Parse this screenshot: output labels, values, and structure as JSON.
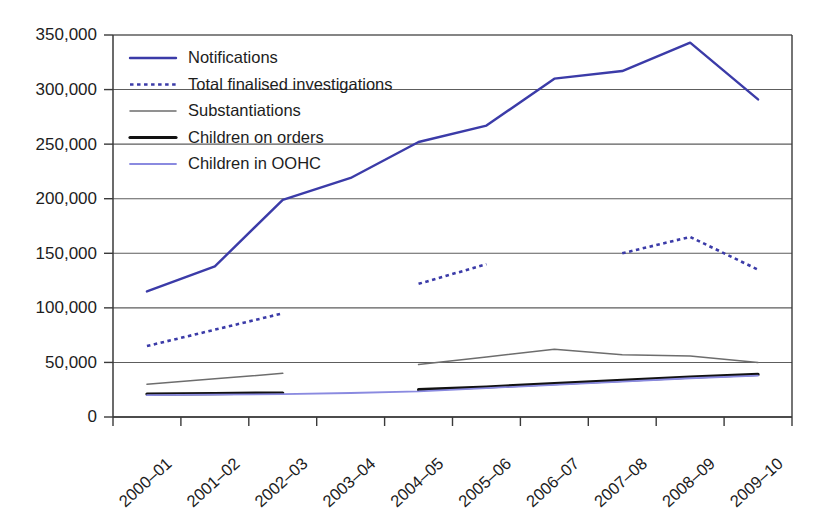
{
  "chart_data": {
    "type": "line",
    "title": "",
    "subtitle": "",
    "xlabel": "",
    "ylabel": "",
    "ylim": [
      0,
      350000
    ],
    "yticks": [
      0,
      50000,
      100000,
      150000,
      200000,
      250000,
      300000,
      350000
    ],
    "ytick_labels": [
      "0",
      "50,000",
      "100,000",
      "150,000",
      "200,000",
      "250,000",
      "300,000",
      "350,000"
    ],
    "grid": "horizontal",
    "legend_position": "inside-top-left",
    "categories": [
      "2000–01",
      "2001–02",
      "2002–03",
      "2003–04",
      "2004–05",
      "2005–06",
      "2006–07",
      "2007–08",
      "2008–09",
      "2009–10"
    ],
    "series": [
      {
        "name": "Notifications",
        "color": "#3b3ba8",
        "style": "solid",
        "width": 2.4,
        "values": [
          115000,
          138000,
          199000,
          219000,
          252000,
          267000,
          310000,
          317000,
          343000,
          291000
        ]
      },
      {
        "name": "Total finalised investigations",
        "color": "#3b3ba8",
        "style": "dotted",
        "width": 2.6,
        "values": [
          65000,
          80000,
          95000,
          null,
          122000,
          140000,
          null,
          150000,
          165000,
          135000
        ]
      },
      {
        "name": "Substantiations",
        "color": "#6d6d6d",
        "style": "solid",
        "width": 1.5,
        "values": [
          30000,
          35000,
          40000,
          null,
          48000,
          55000,
          62000,
          57000,
          56000,
          50000
        ]
      },
      {
        "name": "Children on orders",
        "color": "#121212",
        "style": "solid",
        "width": 3.2,
        "values": [
          21000,
          21500,
          22000,
          null,
          25000,
          27500,
          30500,
          33500,
          36500,
          39000
        ]
      },
      {
        "name": "Children in OOHC",
        "color": "#8a8ae0",
        "style": "solid",
        "width": 1.8,
        "values": [
          20000,
          20500,
          21000,
          22000,
          23500,
          26500,
          29500,
          32500,
          35500,
          38000
        ]
      }
    ]
  },
  "axes": {
    "y_tick_labels": [
      "350,000",
      "300,000",
      "250,000",
      "200,000",
      "150,000",
      "100,000",
      "50,000",
      "0"
    ],
    "x_tick_labels": [
      "2000–01",
      "2001–02",
      "2002–03",
      "2003–04",
      "2004–05",
      "2005–06",
      "2006–07",
      "2007–08",
      "2008–09",
      "2009–10"
    ]
  },
  "legend": {
    "items": [
      {
        "label": "Notifications",
        "color": "#3b3ba8",
        "style": "solid",
        "width": 2.4
      },
      {
        "label": "Total finalised investigations",
        "color": "#3b3ba8",
        "style": "dotted",
        "width": 2.6
      },
      {
        "label": "Substantiations",
        "color": "#6d6d6d",
        "style": "solid",
        "width": 1.5
      },
      {
        "label": "Children on orders",
        "color": "#121212",
        "style": "solid",
        "width": 3.2
      },
      {
        "label": "Children in OOHC",
        "color": "#8a8ae0",
        "style": "solid",
        "width": 1.8
      }
    ]
  }
}
